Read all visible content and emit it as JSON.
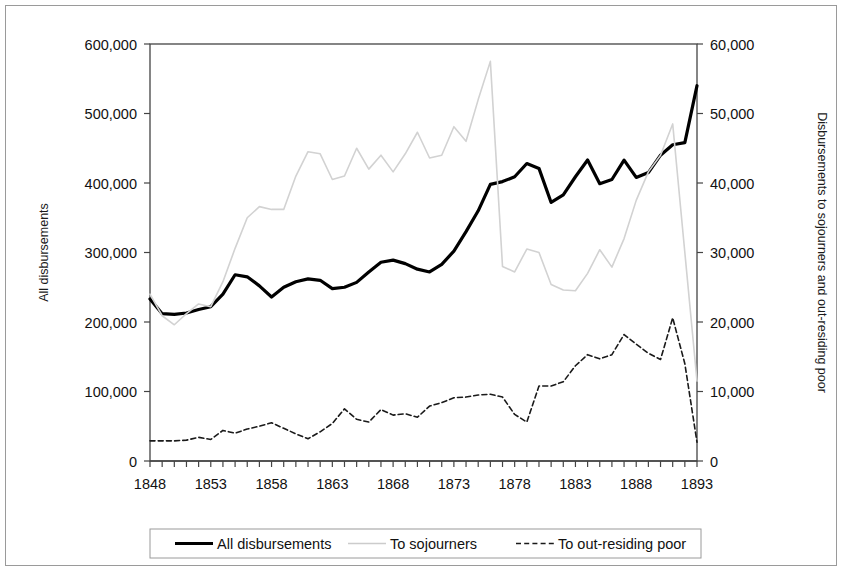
{
  "chart_data": {
    "type": "line",
    "title": "",
    "xlabel": "",
    "ylabel": "All disbursements",
    "y2label": "Disbursements to sojourners and out-residing poor",
    "xlim": [
      1848,
      1893
    ],
    "ylim": [
      0,
      600000
    ],
    "y2lim": [
      0,
      60000
    ],
    "grid": false,
    "legend_position": "bottom",
    "x": [
      1848,
      1849,
      1850,
      1851,
      1852,
      1853,
      1854,
      1855,
      1856,
      1857,
      1858,
      1859,
      1860,
      1861,
      1862,
      1863,
      1864,
      1865,
      1866,
      1867,
      1868,
      1869,
      1870,
      1871,
      1872,
      1873,
      1874,
      1875,
      1876,
      1877,
      1878,
      1879,
      1880,
      1881,
      1882,
      1883,
      1884,
      1885,
      1886,
      1887,
      1888,
      1889,
      1890,
      1891,
      1892,
      1893
    ],
    "xticks": [
      1848,
      1853,
      1858,
      1863,
      1868,
      1873,
      1878,
      1883,
      1888,
      1893
    ],
    "xticklabels": [
      "1848",
      "1853",
      "1858",
      "1863",
      "1868",
      "1873",
      "1878",
      "1883",
      "1888",
      "1893"
    ],
    "yticks": [
      0,
      100000,
      200000,
      300000,
      400000,
      500000,
      600000
    ],
    "yticklabels": [
      "0",
      "100,000",
      "200,000",
      "300,000",
      "400,000",
      "500,000",
      "600,000"
    ],
    "y2ticks": [
      0,
      10000,
      20000,
      30000,
      40000,
      50000,
      60000
    ],
    "y2ticklabels": [
      "0",
      "10,000",
      "20,000",
      "30,000",
      "40,000",
      "50,000",
      "60,000"
    ],
    "series": [
      {
        "name": "All disbursements",
        "axis": "left",
        "style": "solid",
        "color": "#000000",
        "width": 3.2,
        "values": [
          233000,
          212000,
          211000,
          213000,
          218000,
          222000,
          240000,
          268000,
          265000,
          252000,
          236000,
          250000,
          258000,
          262000,
          260000,
          248000,
          250000,
          257000,
          272000,
          286000,
          289000,
          284000,
          276000,
          272000,
          283000,
          302000,
          330000,
          360000,
          398000,
          402000,
          409000,
          428000,
          421000,
          372000,
          383000,
          409000,
          433000,
          399000,
          405000,
          433000,
          408000,
          415000,
          440000,
          455000,
          458000,
          540000
        ]
      },
      {
        "name": "To sojourners",
        "axis": "right",
        "style": "solid",
        "color": "#d2d2d2",
        "width": 1.6,
        "values": [
          24000,
          20900,
          19600,
          21200,
          22600,
          22200,
          25800,
          30600,
          35000,
          36600,
          36200,
          36200,
          41000,
          44500,
          44200,
          40500,
          41000,
          45000,
          42000,
          44000,
          41600,
          44200,
          47300,
          43600,
          44000,
          48100,
          46000,
          52000,
          57500,
          28000,
          27200,
          30500,
          30000,
          25400,
          24600,
          24500,
          27000,
          30400,
          27900,
          32000,
          37500,
          41600,
          44000,
          48500,
          30000,
          11500
        ]
      },
      {
        "name": "To out-residing poor",
        "axis": "right",
        "style": "dashed",
        "color": "#1a1a1a",
        "width": 1.6,
        "values": [
          2900,
          2900,
          2900,
          3000,
          3400,
          3100,
          4400,
          4000,
          4600,
          5000,
          5500,
          4700,
          3900,
          3200,
          4200,
          5400,
          7500,
          6000,
          5600,
          7400,
          6600,
          6800,
          6300,
          7900,
          8400,
          9100,
          9200,
          9500,
          9600,
          9200,
          6700,
          5600,
          10800,
          10800,
          11400,
          13700,
          15300,
          14700,
          15300,
          18200,
          16800,
          15500,
          14600,
          20600,
          14000,
          2700
        ]
      }
    ]
  },
  "legend": {
    "items": [
      {
        "label": "All disbursements",
        "style": "solid",
        "color": "#000000",
        "width": 3.2
      },
      {
        "label": "To sojourners",
        "style": "solid",
        "color": "#cccccc",
        "width": 1.6
      },
      {
        "label": "To out-residing poor",
        "style": "dashed",
        "color": "#1a1a1a",
        "width": 1.6
      }
    ]
  },
  "colors": {
    "axis": "#444444",
    "frame": "#9a9a9a",
    "text": "#111111",
    "background": "#ffffff"
  }
}
